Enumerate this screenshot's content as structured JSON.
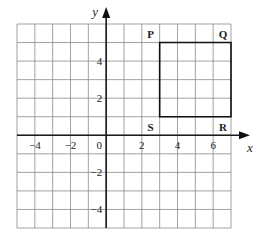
{
  "diagram": {
    "type": "coordinate-grid",
    "x_axis": {
      "label": "x",
      "min": -5,
      "max": 7,
      "ticks": [
        "-4",
        "-2",
        "0",
        "2",
        "4",
        "6"
      ],
      "tick_values": [
        -4,
        -2,
        0,
        2,
        4,
        6
      ]
    },
    "y_axis": {
      "label": "y",
      "min": -5,
      "max": 6,
      "ticks": [
        "4",
        "2",
        "-2",
        "-4"
      ],
      "tick_values": [
        4,
        2,
        -2,
        -4
      ]
    },
    "shape": {
      "name": "square PQRS",
      "vertices": [
        {
          "label": "P",
          "x": 3,
          "y": 5
        },
        {
          "label": "Q",
          "x": 7,
          "y": 5
        },
        {
          "label": "R",
          "x": 7,
          "y": 1
        },
        {
          "label": "S",
          "x": 3,
          "y": 1
        }
      ]
    },
    "colors": {
      "grid": "#8a8a8a",
      "axis": "#1a1a1a",
      "shape": "#111111"
    }
  }
}
